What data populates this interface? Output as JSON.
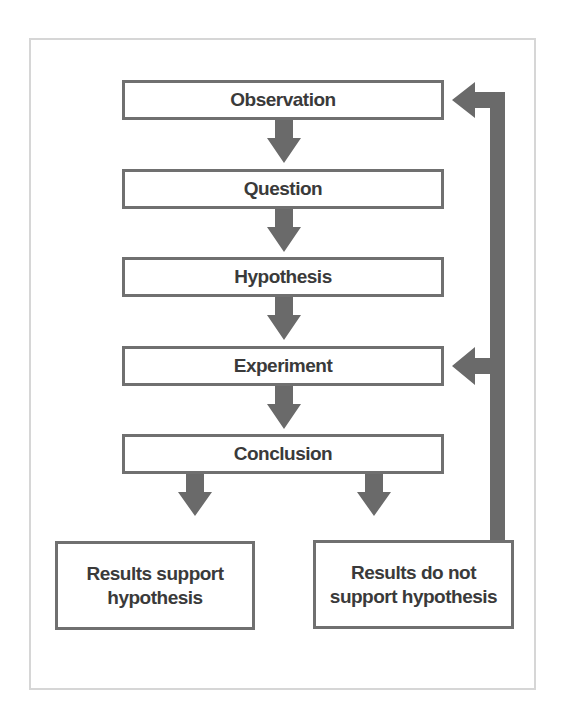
{
  "diagram": {
    "colors": {
      "box_border": "#707070",
      "arrow": "#6a6a6a",
      "text": "#3a3a3a",
      "frame": "#d6d6d6"
    },
    "steps": [
      {
        "label": "Observation"
      },
      {
        "label": "Question"
      },
      {
        "label": "Hypothesis"
      },
      {
        "label": "Experiment"
      },
      {
        "label": "Conclusion"
      }
    ],
    "outcomes": [
      {
        "line1": "Results support",
        "line2": "hypothesis"
      },
      {
        "line1": "Results do not",
        "line2": "support hypothesis"
      }
    ],
    "feedback": {
      "from": "Results do not support hypothesis",
      "to": [
        "Experiment",
        "Observation"
      ]
    }
  }
}
